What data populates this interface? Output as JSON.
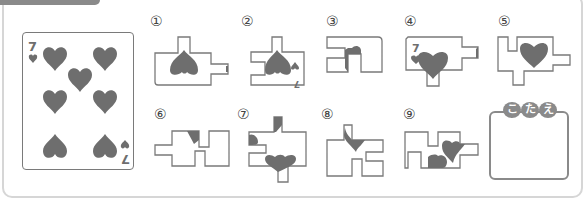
{
  "header": {
    "tab_color": "#8a8a8a"
  },
  "card": {
    "rank": "7",
    "suit": "hearts",
    "pip_count": 7,
    "ink_color": "#6e6e6e"
  },
  "pieces": [
    {
      "id": 1,
      "label": "①"
    },
    {
      "id": 2,
      "label": "②"
    },
    {
      "id": 3,
      "label": "③"
    },
    {
      "id": 4,
      "label": "④",
      "corner_rank": "7"
    },
    {
      "id": 5,
      "label": "⑤"
    },
    {
      "id": 6,
      "label": "⑥"
    },
    {
      "id": 7,
      "label": "⑦"
    },
    {
      "id": 8,
      "label": "⑧"
    },
    {
      "id": 9,
      "label": "⑨"
    }
  ],
  "answer": {
    "title_chars": [
      "こ",
      "た",
      "え"
    ],
    "value": ""
  },
  "colors": {
    "outline": "#7a7a7a",
    "fill": "#6e6e6e",
    "frame_border": "#d6d6d6"
  }
}
